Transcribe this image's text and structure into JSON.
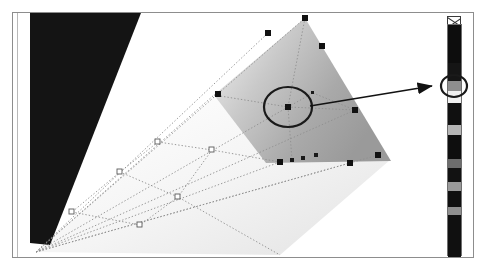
{
  "app": {
    "title": "Gradient Mesh Editing",
    "canvas_label": "artboard"
  },
  "document_frame": {
    "border_color": "#8d8d8d",
    "background": "#ffffff",
    "x": 12,
    "y": 12,
    "width": 462,
    "height": 246
  },
  "artwork": {
    "wedge": {
      "name": "black-wedge-shape",
      "fill": "#141414",
      "points": "30,13 140,13 48,240 30,238"
    },
    "mesh_object": {
      "name": "gradient-mesh-shape",
      "description": "triangular gradient mesh, light at upper-left to mid-gray at right",
      "outline": "305,18 390,160 268,160 215,96",
      "fill_light": "#f2f2f2",
      "fill_mid": "#b4b4b4",
      "fill_dark": "#8f8f8f"
    },
    "mesh_lines": {
      "name": "mesh-guide-lines",
      "style": "dotted",
      "color": "#8a8a8a"
    }
  },
  "mesh_points": [
    {
      "name": "mesh-point-apex",
      "x": 305,
      "y": 18,
      "state": "selected"
    },
    {
      "name": "mesh-point-top-left",
      "x": 268,
      "y": 33,
      "state": "selected"
    },
    {
      "name": "mesh-point-top-right",
      "x": 322,
      "y": 46,
      "state": "selected"
    },
    {
      "name": "mesh-point-left-upper",
      "x": 218,
      "y": 94,
      "state": "selected"
    },
    {
      "name": "mesh-point-center",
      "x": 288,
      "y": 107,
      "state": "selected"
    },
    {
      "name": "mesh-point-right-mid",
      "x": 355,
      "y": 110,
      "state": "selected"
    },
    {
      "name": "mesh-point-small-upper",
      "x": 313,
      "y": 93,
      "state": "small"
    },
    {
      "name": "mesh-point-bottom-a",
      "x": 280,
      "y": 162,
      "state": "selected"
    },
    {
      "name": "mesh-point-bottom-b",
      "x": 292,
      "y": 160,
      "state": "small"
    },
    {
      "name": "mesh-point-bottom-c",
      "x": 303,
      "y": 158,
      "state": "small"
    },
    {
      "name": "mesh-point-bottom-d",
      "x": 316,
      "y": 155,
      "state": "small"
    },
    {
      "name": "mesh-point-bottom-e",
      "x": 350,
      "y": 163,
      "state": "selected"
    },
    {
      "name": "mesh-point-bottom-right",
      "x": 378,
      "y": 155,
      "state": "selected"
    },
    {
      "name": "mesh-point-outer-left",
      "x": 158,
      "y": 142,
      "state": "hollow"
    },
    {
      "name": "mesh-point-outer-lower",
      "x": 120,
      "y": 172,
      "state": "hollow"
    },
    {
      "name": "mesh-point-outer-far",
      "x": 72,
      "y": 212,
      "state": "hollow"
    },
    {
      "name": "mesh-point-outer-bot",
      "x": 140,
      "y": 225,
      "state": "hollow"
    },
    {
      "name": "mesh-point-outer-mid",
      "x": 178,
      "y": 197,
      "state": "hollow"
    },
    {
      "name": "mesh-point-outer-up",
      "x": 212,
      "y": 150,
      "state": "hollow"
    }
  ],
  "annotation": {
    "highlight_circle": {
      "name": "selected-node-highlight",
      "cx": 288,
      "cy": 107,
      "rx": 24,
      "ry": 20,
      "stroke": "#1a1a1a",
      "stroke_width": 2
    },
    "arrow": {
      "name": "callout-arrow",
      "from_x": 310,
      "from_y": 106,
      "to_x": 434,
      "to_y": 86,
      "color": "#121212"
    },
    "swatch_circle": {
      "name": "selected-swatch-highlight",
      "cx": 454,
      "cy": 86,
      "rx": 13,
      "ry": 11,
      "stroke": "#1a1a1a",
      "stroke_width": 2
    }
  },
  "palette": {
    "name": "color-palette-strip",
    "menu_icon": "palette-menu-icon",
    "none_swatch_label": "none-swatch",
    "selected_index": 3,
    "swatches": [
      {
        "name": "swatch-black-1",
        "color": "#0d0d0d",
        "height": 38
      },
      {
        "name": "swatch-black-2",
        "color": "#151515",
        "height": 18
      },
      {
        "name": "swatch-gray-mid",
        "color": "#8e8e8e",
        "height": 10
      },
      {
        "name": "swatch-white-1",
        "color": "#f0f0f0",
        "height": 12
      },
      {
        "name": "swatch-black-3",
        "color": "#101010",
        "height": 22
      },
      {
        "name": "swatch-gray-lt",
        "color": "#b5b5b5",
        "height": 10
      },
      {
        "name": "swatch-black-4",
        "color": "#0e0e0e",
        "height": 24
      },
      {
        "name": "swatch-gray-dk",
        "color": "#6d6d6d",
        "height": 9
      },
      {
        "name": "swatch-black-5",
        "color": "#121212",
        "height": 14
      },
      {
        "name": "swatch-gray-md2",
        "color": "#9a9a9a",
        "height": 9
      },
      {
        "name": "swatch-black-6",
        "color": "#0f0f0f",
        "height": 16
      },
      {
        "name": "swatch-gray-lt2",
        "color": "#8f8f8f",
        "height": 8
      },
      {
        "name": "swatch-black-7",
        "color": "#101010",
        "height": 42
      }
    ]
  }
}
